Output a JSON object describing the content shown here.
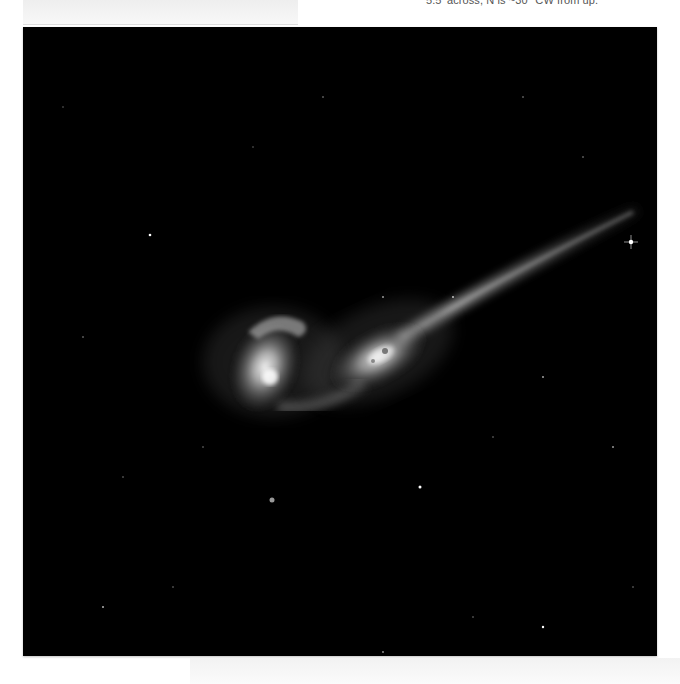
{
  "caption": {
    "text": "5.5' across, N is ~30° CW from up."
  },
  "image": {
    "subject": "interacting-galaxy-pair-with-long-tidal-tail",
    "background_color": "#000000",
    "galaxy_color": "#e8e8e8"
  }
}
